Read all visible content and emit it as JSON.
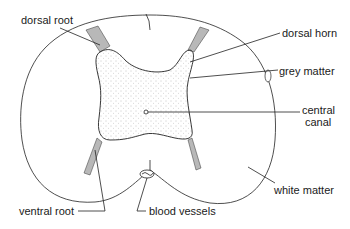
{
  "labels": {
    "dorsal_root": "dorsal root",
    "dorsal_horn": "dorsal horn",
    "grey_matter": "grey matter",
    "central_canal_line1": "central",
    "central_canal_line2": "canal",
    "white_matter": "white matter",
    "ventral_root": "ventral root",
    "blood_vessels": "blood vessels"
  },
  "colors": {
    "stroke": "#222222",
    "grey_matter_dots": "#888888",
    "background": "#ffffff"
  }
}
